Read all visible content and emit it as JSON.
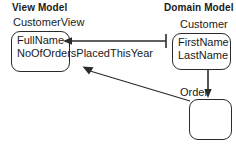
{
  "diagram": {
    "columns": [
      {
        "id": "view-model",
        "title": "View Model"
      },
      {
        "id": "domain-model",
        "title": "Domain Model"
      }
    ],
    "entities": [
      {
        "id": "customerview",
        "name": "CustomerView",
        "attributes": [
          "FullName",
          "NoOfOrdersPlacedThisYear"
        ],
        "attributes_text": "FullName\nNoOfOrdersPlacedThisYear"
      },
      {
        "id": "customer",
        "name": "Customer",
        "attributes": [
          "FirstName",
          "LastName"
        ],
        "attributes_text": "FirstName\nLastName"
      },
      {
        "id": "order",
        "name": "Order",
        "attributes": [],
        "attributes_text": ""
      }
    ],
    "connectors": [
      {
        "id": "customer-to-fullname",
        "from": "customer",
        "to": "customerview.FullName",
        "style": "line-with-arrowhead",
        "direction": "right-to-left"
      },
      {
        "id": "order-to-noofordersplacedthisyear",
        "from": "order",
        "to": "customerview.NoOfOrdersPlacedThisYear",
        "style": "diagonal-arrow",
        "direction": "lower-right-to-upper-left"
      },
      {
        "id": "customer-to-order",
        "from": "customer",
        "to": "order",
        "style": "vertical-arrow",
        "direction": "top-to-bottom"
      }
    ],
    "colors": {
      "stroke": "#2b2b2b",
      "text": "#1a1a1a",
      "background": "#ffffff"
    }
  }
}
